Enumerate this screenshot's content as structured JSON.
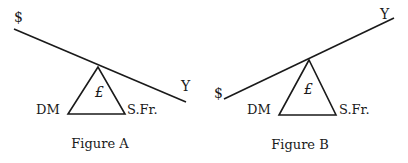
{
  "figures": [
    {
      "caption": "Figure A",
      "labels": {
        "left_end": "$",
        "right_end": "Y",
        "fulcrum": "£",
        "base_left": "DM",
        "base_right": "S.Fr."
      }
    },
    {
      "caption": "Figure B",
      "labels": {
        "left_end": "$",
        "right_end": "Y",
        "fulcrum": "£",
        "base_left": "DM",
        "base_right": "S.Fr."
      }
    }
  ],
  "colors": {
    "ink": "#1a1a1a",
    "background": "#ffffff"
  }
}
